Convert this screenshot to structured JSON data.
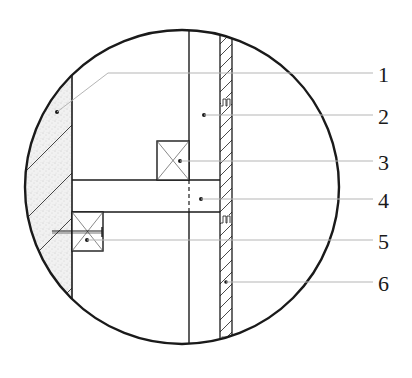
{
  "diagram": {
    "type": "construction-detail-section",
    "view": "circular-detail-callout",
    "colors": {
      "line": "#1a1a1a",
      "leader": "#b5b5b5",
      "fill_wall": "#f1f1f1",
      "background": "#ffffff"
    },
    "labels": [
      {
        "id": "1",
        "text": "1"
      },
      {
        "id": "2",
        "text": "2"
      },
      {
        "id": "3",
        "text": "3"
      },
      {
        "id": "4",
        "text": "4"
      },
      {
        "id": "5",
        "text": "5"
      },
      {
        "id": "6",
        "text": "6"
      }
    ],
    "components": [
      {
        "callout": "1",
        "element": "masonry-wall",
        "pattern": "stipple-with-diagonal-hatch"
      },
      {
        "callout": "2",
        "element": "vertical-stud",
        "pattern": "blank"
      },
      {
        "callout": "3",
        "element": "timber-block-upper",
        "pattern": "cross"
      },
      {
        "callout": "4",
        "element": "horizontal-joist",
        "pattern": "blank"
      },
      {
        "callout": "5",
        "element": "timber-block-lower-with-nail",
        "pattern": "cross"
      },
      {
        "callout": "6",
        "element": "hatched-board",
        "pattern": "diagonal-hatch"
      }
    ]
  }
}
